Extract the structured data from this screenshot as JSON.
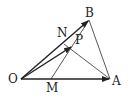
{
  "diagram": {
    "type": "vector-triangle",
    "labels": {
      "O": "O",
      "A": "A",
      "B": "B",
      "M": "M",
      "N": "N",
      "P": "P"
    },
    "points": {
      "O": [
        21,
        79
      ],
      "A": [
        110,
        79
      ],
      "B": [
        89,
        20
      ],
      "M": [
        51,
        79
      ],
      "N": [
        64,
        44
      ],
      "P": [
        72,
        46
      ]
    },
    "arrows": [
      "OA",
      "OB",
      "OP"
    ],
    "segments": [
      "AB",
      "MB",
      "AN"
    ],
    "color": "#222222"
  }
}
